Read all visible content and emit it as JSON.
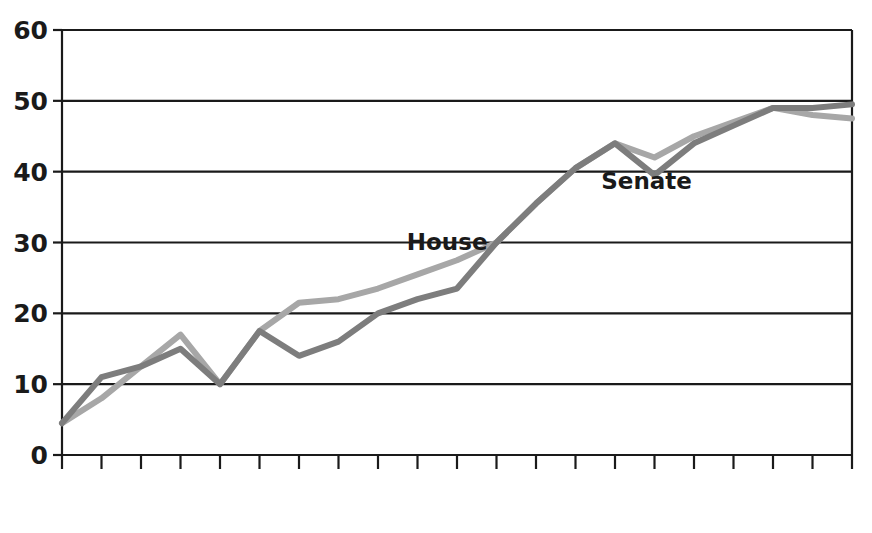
{
  "chart_data": {
    "type": "line",
    "title": "",
    "subtitle": "",
    "xlabel": "",
    "ylabel": "",
    "xlim": [
      1960,
      2010
    ],
    "ylim": [
      0,
      60
    ],
    "yticks": [
      0,
      10,
      20,
      30,
      40,
      50,
      60
    ],
    "ytick_labels": [
      "0",
      "10",
      "20",
      "30",
      "40",
      "50",
      "60"
    ],
    "grid": "horizontal",
    "legend_position": "inline-annotation",
    "xtick_labels": [
      "1960",
      "1964",
      "1968",
      "1972",
      "1976",
      "1980",
      "1982",
      "1984",
      "1986",
      "1988",
      "1990",
      "1992",
      "1994",
      "1996",
      "1998",
      "2000",
      "2002",
      "2004",
      "2006",
      "2008",
      "2010"
    ],
    "x": [
      1960,
      1964,
      1968,
      1972,
      1976,
      1980,
      1982,
      1984,
      1986,
      1988,
      1990,
      1992,
      1994,
      1996,
      1998,
      2000,
      2002,
      2004,
      2006,
      2008,
      2010
    ],
    "series": [
      {
        "name": "House",
        "color": "#a7a7a7",
        "annotation": "House",
        "values": [
          4.5,
          8.0,
          12.5,
          17.0,
          10.0,
          17.5,
          21.5,
          22.0,
          23.5,
          25.5,
          27.5,
          30.0,
          35.5,
          40.5,
          44.0,
          42.0,
          45.0,
          47.0,
          49.0,
          48.0,
          47.5
        ]
      },
      {
        "name": "Senate",
        "color": "#7d7d7d",
        "annotation": "Senate",
        "values": [
          4.5,
          11.0,
          12.5,
          15.0,
          10.0,
          17.5,
          14.0,
          16.0,
          20.0,
          22.0,
          23.5,
          30.0,
          35.5,
          40.5,
          44.0,
          39.5,
          44.0,
          46.5,
          49.0,
          49.0,
          49.5
        ]
      }
    ],
    "annotations": [
      {
        "text": "House",
        "x_value": 1989.5,
        "y_value": 29.0
      },
      {
        "text": "Senate",
        "x_value": 1999.6,
        "y_value": 37.5
      }
    ]
  },
  "plot_geometry": {
    "left_px": 62,
    "right_px": 852,
    "top_px": 30,
    "bottom_px": 455
  }
}
